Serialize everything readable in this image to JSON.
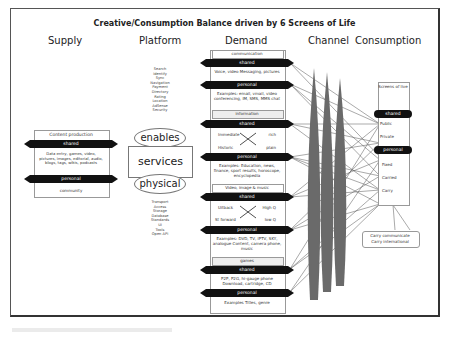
{
  "title": "Creative/Consumption Balance driven by 6 Screens of Life",
  "columns": [
    "Supply",
    "Platform",
    "Demand",
    "Channel",
    "Consumption"
  ],
  "supply": {
    "header": "Content production",
    "shared_label": "shared",
    "shared_text": "Data entry, games, video, pictures, images, editorial, audio, blogs, tags, wikis, podcasts",
    "personal_label": "personal",
    "personal_text": "community"
  },
  "platform": {
    "upper_list": [
      "Search",
      "Identify",
      "Sync",
      "Navigation",
      "Payment",
      "Directory",
      "Rating",
      "Location",
      "AdSense",
      "Security"
    ],
    "enables": "enables",
    "services": "services",
    "physical": "physical",
    "lower_list": [
      "Transport",
      "Access",
      "Storage",
      "Database",
      "Standards",
      "UI",
      "Tools",
      "Open API"
    ]
  },
  "demand": {
    "sections": [
      {
        "header": "communication",
        "shared": "shared",
        "shared_text": "Voice, video Messaging, pictures",
        "personal": "personal",
        "personal_text": "Examples: email, vmail, video conferencing, IM, SMS, MMS chat"
      },
      {
        "header": "information",
        "shared": "shared",
        "shared_text_tl": "Immediate",
        "shared_text_tr": "rich",
        "shared_text_bl": "Historic",
        "shared_text_br": "plain",
        "personal": "personal",
        "personal_text": "Examples: Education, news, finance, sport results, horoscope, encyclopedia"
      },
      {
        "header": "Video, image & music",
        "shared": "shared",
        "shared_text_tl": "Uitback",
        "shared_text_tr": "High Q",
        "shared_text_bl": "St forward",
        "shared_text_br": "low Q",
        "personal": "personal",
        "personal_text": "Examples: DVD, TV, IPTV, SKY, analogue Content, camera phone, music"
      },
      {
        "header": "games",
        "shared": "shared",
        "shared_text": "P2P, P2G, hi-gauge phone Download, cartridge, CD",
        "personal": "personal",
        "personal_text": "Examples Titles, genre"
      }
    ]
  },
  "consumption": {
    "header": "Screens of live",
    "shared": "shared",
    "items_shared": [
      "Public",
      "Private"
    ],
    "personal": "personal",
    "items_personal": [
      "Fixed",
      "Carried",
      "Carry"
    ],
    "callout": [
      "Carry communicate",
      "Carry international"
    ]
  }
}
